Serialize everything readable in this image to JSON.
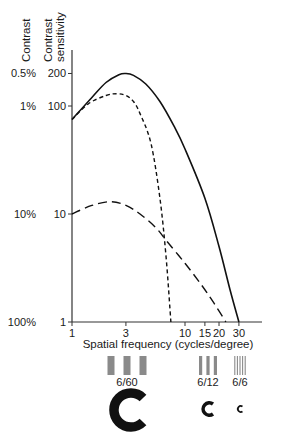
{
  "chart_data": {
    "type": "line",
    "title": "",
    "xlabel": "Spatial frequency (cycles/degree)",
    "ylabel": "Contrast sensitivity",
    "ylabel_secondary": "Contrast",
    "xscale": "log",
    "yscale": "log",
    "xlim": [
      1,
      30
    ],
    "ylim": [
      1,
      200
    ],
    "grid": false,
    "legend": null,
    "x_ticks": [
      1,
      3,
      10,
      15,
      20,
      30
    ],
    "x_tick_labels": [
      "1",
      "3",
      "10",
      "15",
      "20",
      "30"
    ],
    "y_ticks": [
      1,
      10,
      100,
      200
    ],
    "y_tick_labels": [
      "1",
      "10",
      "100",
      "200"
    ],
    "y_secondary_tick_labels": [
      "100%",
      "10%",
      "1%",
      "0.5%"
    ],
    "series": [
      {
        "name": "solid curve",
        "style": "solid",
        "points": [
          [
            1,
            75
          ],
          [
            1.5,
            120
          ],
          [
            2,
            165
          ],
          [
            2.6,
            195
          ],
          [
            3,
            200
          ],
          [
            3.5,
            192
          ],
          [
            4.5,
            160
          ],
          [
            6,
            110
          ],
          [
            8,
            65
          ],
          [
            10,
            40
          ],
          [
            15,
            14
          ],
          [
            20,
            5
          ],
          [
            25,
            2
          ],
          [
            30,
            1
          ]
        ]
      },
      {
        "name": "short-dashed curve",
        "style": "short-dash",
        "points": [
          [
            1,
            75
          ],
          [
            1.4,
            105
          ],
          [
            2,
            125
          ],
          [
            2.5,
            130
          ],
          [
            3,
            125
          ],
          [
            3.5,
            110
          ],
          [
            4,
            85
          ],
          [
            5,
            45
          ],
          [
            6,
            14
          ],
          [
            6.8,
            4
          ],
          [
            7.5,
            1
          ]
        ]
      },
      {
        "name": "long-dashed curve",
        "style": "long-dash",
        "points": [
          [
            1,
            10
          ],
          [
            1.5,
            12
          ],
          [
            2.2,
            13
          ],
          [
            3,
            12
          ],
          [
            4,
            10
          ],
          [
            5.5,
            7.5
          ],
          [
            7,
            5.5
          ],
          [
            10,
            3.5
          ],
          [
            14,
            2.2
          ],
          [
            18,
            1.5
          ],
          [
            23,
            1
          ]
        ]
      }
    ],
    "annotations": [
      {
        "type": "grating",
        "label": "6/60",
        "bars": 3,
        "x_center": 127
      },
      {
        "type": "grating",
        "label": "6/12",
        "bars": 3,
        "x_center": 208
      },
      {
        "type": "grating",
        "label": "6/6",
        "bars": 5,
        "x_center": 240
      },
      {
        "type": "landolt-c",
        "size": "large",
        "x_center": 127
      },
      {
        "type": "landolt-c",
        "size": "medium",
        "x_center": 208
      },
      {
        "type": "landolt-c",
        "size": "small",
        "x_center": 240
      }
    ]
  },
  "labels": {
    "y_title_contrast": "Contrast",
    "y_title_sensitivity_1": "Contrast",
    "y_title_sensitivity_2": "sensitivity",
    "x_title": "Spatial frequency (cycles/degree)",
    "grating_6_60": "6/60",
    "grating_6_12": "6/12",
    "grating_6_6": "6/6"
  }
}
